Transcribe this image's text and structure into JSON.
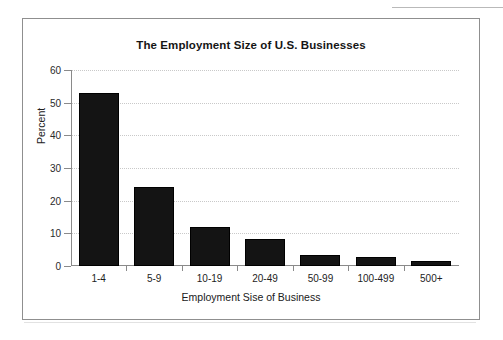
{
  "chart_data": {
    "type": "bar",
    "title": "The Employment Size of U.S. Businesses",
    "xlabel": "Employment Sise of Business",
    "ylabel": "Percent",
    "categories": [
      "1-4",
      "5-9",
      "10-19",
      "20-49",
      "50-99",
      "100-499",
      "500+"
    ],
    "values": [
      53.0,
      24.2,
      11.9,
      8.4,
      3.4,
      2.8,
      1.6
    ],
    "ylim": [
      0,
      60
    ],
    "yticks": [
      0,
      10,
      20,
      30,
      40,
      50,
      60
    ],
    "ytick_labels": [
      "0",
      "10",
      "20",
      "30",
      "40",
      "50",
      "60"
    ],
    "grid": true,
    "grid_style": "dotted-horizontal",
    "legend": null,
    "bar_color": "#141414",
    "frame_color": "#8f8f8f",
    "grid_color": "#c9c9c9"
  }
}
